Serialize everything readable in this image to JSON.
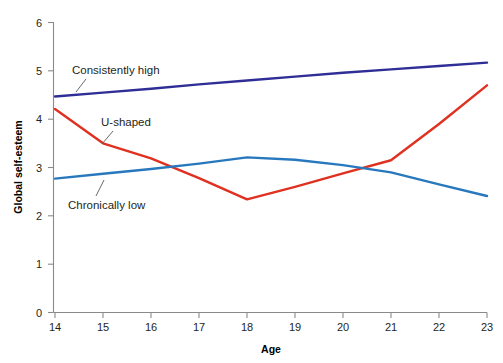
{
  "chart_data": {
    "type": "line",
    "title": "",
    "xlabel": "Age",
    "ylabel": "Global self-esteem",
    "x": [
      14,
      15,
      16,
      17,
      18,
      19,
      20,
      21,
      22,
      23
    ],
    "xlim": [
      14,
      23
    ],
    "ylim": [
      0,
      6
    ],
    "xticks": [
      "14",
      "15",
      "16",
      "17",
      "18",
      "19",
      "20",
      "21",
      "22",
      "23"
    ],
    "yticks": [
      "0",
      "1",
      "2",
      "3",
      "4",
      "5",
      "6"
    ],
    "grid": false,
    "legend_position": "inline-annotations",
    "series": [
      {
        "name": "Consistently high",
        "color": "#2e2e96",
        "values": [
          4.47,
          4.55,
          4.63,
          4.72,
          4.8,
          4.88,
          4.96,
          5.03,
          5.1,
          5.17
        ]
      },
      {
        "name": "U-shaped",
        "color": "#e03020",
        "values": [
          4.21,
          3.5,
          3.19,
          2.78,
          2.34,
          2.6,
          2.88,
          3.15,
          3.9,
          4.7
        ]
      },
      {
        "name": "Chronically low",
        "color": "#2878be",
        "values": [
          2.77,
          2.87,
          2.97,
          3.08,
          3.21,
          3.16,
          3.05,
          2.9,
          2.65,
          2.41
        ]
      }
    ],
    "annotations": [
      {
        "text": "Consistently high",
        "series": "Consistently high",
        "x_px": 72,
        "y_px": 74
      },
      {
        "text": "U-shaped",
        "series": "U-shaped",
        "x_px": 101,
        "y_px": 126
      },
      {
        "text": "Chronically low",
        "series": "Chronically low",
        "x_px": 68,
        "y_px": 203
      }
    ]
  }
}
